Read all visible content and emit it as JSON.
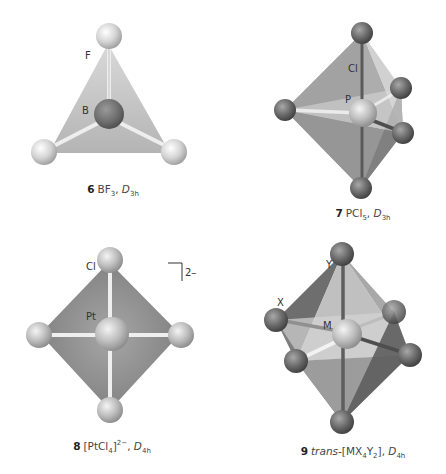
{
  "figures": [
    {
      "number": "6",
      "formula": "BF",
      "formula_sub": "3",
      "point_group": "D",
      "point_group_sub": "3h",
      "geometry": "trigonal planar",
      "atom_labels": {
        "central": "B",
        "ligand": "F"
      }
    },
    {
      "number": "7",
      "formula": "PCl",
      "formula_sub": "5",
      "point_group": "D",
      "point_group_sub": "3h",
      "geometry": "trigonal bipyramidal",
      "atom_labels": {
        "central": "P",
        "ligand": "Cl"
      }
    },
    {
      "number": "8",
      "formula_open": "[PtCl",
      "formula_sub": "4",
      "formula_close": "]",
      "charge": "2−",
      "point_group": "D",
      "point_group_sub": "4h",
      "geometry": "square planar",
      "atom_labels": {
        "central": "Pt",
        "ligand": "Cl"
      },
      "bracket_charge": "2–"
    },
    {
      "number": "9",
      "prefix": "trans-",
      "formula_open": "[MX",
      "formula_sub1": "4",
      "formula_mid": "Y",
      "formula_sub2": "2",
      "formula_close": "]",
      "point_group": "D",
      "point_group_sub": "4h",
      "geometry": "octahedral",
      "atom_labels": {
        "central": "M",
        "ligand_x": "X",
        "ligand_y": "Y"
      }
    }
  ],
  "colors": {
    "background": "#ffffff",
    "light_sphere": "#d6d6d6",
    "dark_sphere": "#6f6f6f",
    "face_light": "#c4c4c4",
    "face_dark": "#8a8a8a",
    "bond": "#e8e8e8"
  }
}
